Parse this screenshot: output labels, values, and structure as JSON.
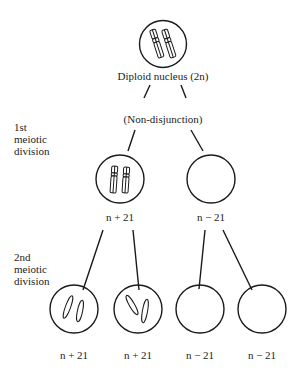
{
  "diagram": {
    "type": "flow",
    "top_node": {
      "label": "Diploid nucleus (2n)",
      "chromosomes": 2
    },
    "event_label": "(Non-disjunction)",
    "stage_labels": {
      "first": [
        "1st",
        "meiotic",
        "division"
      ],
      "second": [
        "2nd",
        "meiotic",
        "division"
      ]
    },
    "first_division": [
      {
        "label": "n + 21",
        "chromosomes": 2
      },
      {
        "label": "n − 21",
        "chromosomes": 0
      }
    ],
    "second_division": [
      {
        "label": "n + 21",
        "chromosomes": 2
      },
      {
        "label": "n + 21",
        "chromosomes": 2
      },
      {
        "label": "n − 21",
        "chromosomes": 0
      },
      {
        "label": "n − 21",
        "chromosomes": 0
      }
    ],
    "edges": [
      [
        "top_node",
        "event_label"
      ],
      [
        "event_label",
        "first_division.0"
      ],
      [
        "event_label",
        "first_division.1"
      ],
      [
        "first_division.0",
        "second_division.0"
      ],
      [
        "first_division.0",
        "second_division.1"
      ],
      [
        "first_division.1",
        "second_division.2"
      ],
      [
        "first_division.1",
        "second_division.3"
      ]
    ],
    "colors": {
      "stroke": "#1a1a1a",
      "background": "#ffffff"
    }
  }
}
